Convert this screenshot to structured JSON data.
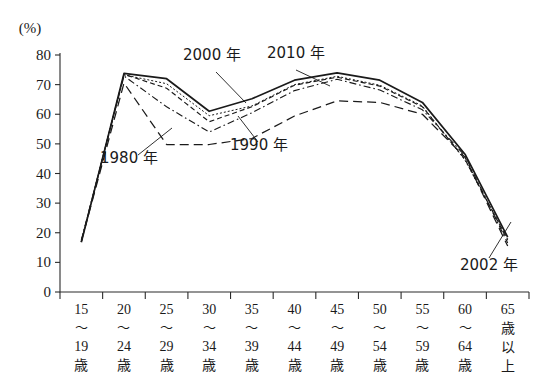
{
  "chart_data": {
    "type": "line",
    "title": "",
    "xlabel": "",
    "ylabel": "(%)",
    "ylim": [
      0,
      80
    ],
    "yticks": [
      0,
      10,
      20,
      30,
      40,
      50,
      60,
      70,
      80
    ],
    "grid": false,
    "legend_position": "inline-annotations",
    "categories": [
      "15～19歳",
      "20～24歳",
      "25～29歳",
      "30～34歳",
      "35～39歳",
      "40～44歳",
      "45～49歳",
      "50～54歳",
      "55～59歳",
      "60～64歳",
      "65歳以上"
    ],
    "category_parts": [
      {
        "top": "15",
        "mid": "～",
        "bottom": "19",
        "suffix": "歳",
        "stacked": false
      },
      {
        "top": "20",
        "mid": "～",
        "bottom": "24",
        "suffix": "歳",
        "stacked": false
      },
      {
        "top": "25",
        "mid": "～",
        "bottom": "29",
        "suffix": "歳",
        "stacked": false
      },
      {
        "top": "30",
        "mid": "～",
        "bottom": "34",
        "suffix": "歳",
        "stacked": false
      },
      {
        "top": "35",
        "mid": "～",
        "bottom": "39",
        "suffix": "歳",
        "stacked": false
      },
      {
        "top": "40",
        "mid": "～",
        "bottom": "44",
        "suffix": "歳",
        "stacked": false
      },
      {
        "top": "45",
        "mid": "～",
        "bottom": "49",
        "suffix": "歳",
        "stacked": false
      },
      {
        "top": "50",
        "mid": "～",
        "bottom": "54",
        "suffix": "歳",
        "stacked": false
      },
      {
        "top": "55",
        "mid": "～",
        "bottom": "59",
        "suffix": "歳",
        "stacked": false
      },
      {
        "top": "60",
        "mid": "～",
        "bottom": "64",
        "suffix": "歳",
        "stacked": false
      },
      {
        "top": "65",
        "mid": "歳",
        "bottom": "以",
        "suffix": "上",
        "stacked": true
      }
    ],
    "series": [
      {
        "name": "1980 年",
        "label": "1980 年",
        "style": "long-dash",
        "values": [
          17.0,
          70.5,
          49.8,
          49.8,
          51.8,
          59.4,
          64.5,
          64.0,
          60.0,
          45.5,
          15.5
        ]
      },
      {
        "name": "1990 年",
        "label": "1990 年",
        "style": "dash-dot",
        "values": [
          17.5,
          72.9,
          62.5,
          54.0,
          60.5,
          68.0,
          71.8,
          68.2,
          61.5,
          46.0,
          16.5
        ]
      },
      {
        "name": "2000 年",
        "label": "2000 年",
        "style": "dashed",
        "values": [
          17.0,
          73.5,
          68.8,
          57.5,
          62.5,
          69.8,
          72.5,
          69.5,
          62.5,
          44.8,
          17.5
        ]
      },
      {
        "name": "2002 年",
        "label": "2002 年",
        "style": "dotted-fine",
        "values": [
          17.0,
          73.3,
          70.3,
          59.5,
          62.8,
          70.0,
          72.8,
          69.8,
          62.8,
          44.5,
          18.0
        ]
      },
      {
        "name": "2010 年",
        "label": "2010 年",
        "style": "solid",
        "values": [
          16.8,
          73.8,
          72.0,
          61.0,
          65.2,
          71.5,
          74.0,
          71.5,
          64.0,
          46.5,
          18.5
        ]
      }
    ],
    "annotations": [
      {
        "id": "label-1980",
        "text": "1980 年",
        "x": 100,
        "y": 163
      },
      {
        "id": "label-1990",
        "text": "1990 年",
        "x": 230,
        "y": 150
      },
      {
        "id": "label-2000",
        "text": "2000 年",
        "x": 183,
        "y": 60
      },
      {
        "id": "label-2010",
        "text": "2010 年",
        "x": 267,
        "y": 58
      },
      {
        "id": "label-2002",
        "text": "2002 年",
        "x": 460,
        "y": 270
      }
    ]
  },
  "axis": {
    "unit": "(%)",
    "ytick_labels": [
      "0",
      "10",
      "20",
      "30",
      "40",
      "50",
      "60",
      "70",
      "80"
    ]
  }
}
